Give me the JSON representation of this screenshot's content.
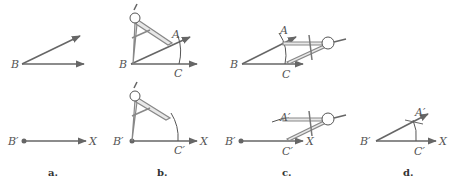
{
  "figure": {
    "panels": [
      {
        "caption": "a.",
        "top_labels": {
          "vertex": "B"
        },
        "bottom_labels": {
          "vertex": "B′",
          "ray_end": "X"
        }
      },
      {
        "caption": "b.",
        "top_labels": {
          "vertex": "B",
          "a": "A",
          "c": "C"
        },
        "bottom_labels": {
          "vertex": "B′",
          "c": "C′",
          "ray_end": "X"
        }
      },
      {
        "caption": "c.",
        "top_labels": {
          "vertex": "B",
          "a": "A",
          "c": "C"
        },
        "bottom_labels": {
          "vertex": "B′",
          "a": "A′",
          "c": "C′",
          "ray_end": "X"
        }
      },
      {
        "caption": "d.",
        "bottom_labels": {
          "vertex": "B′",
          "a": "A′",
          "c": "C′",
          "ray_end": "X"
        }
      }
    ]
  }
}
